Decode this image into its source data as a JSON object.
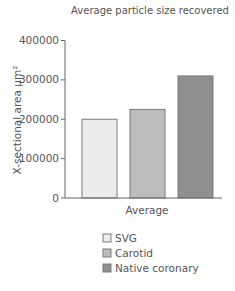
{
  "chart_data": {
    "type": "bar",
    "title": "Average particle size recovered",
    "xlabel": "",
    "ylabel": "X-sectional area µm²",
    "categories": [
      "Average"
    ],
    "series": [
      {
        "name": "SVG",
        "values": [
          200000
        ],
        "color": "#ececec"
      },
      {
        "name": "Carotid",
        "values": [
          225000
        ],
        "color": "#bdbdbd"
      },
      {
        "name": "Native coronary",
        "values": [
          310000
        ],
        "color": "#8f8f8f"
      }
    ],
    "ylim": [
      0,
      400000
    ],
    "yticks": [
      0,
      100000,
      200000,
      300000,
      400000
    ],
    "ytick_labels": [
      "0",
      "100000",
      "200000",
      "300000",
      "400000"
    ],
    "grid": false,
    "legend": "bottom"
  }
}
